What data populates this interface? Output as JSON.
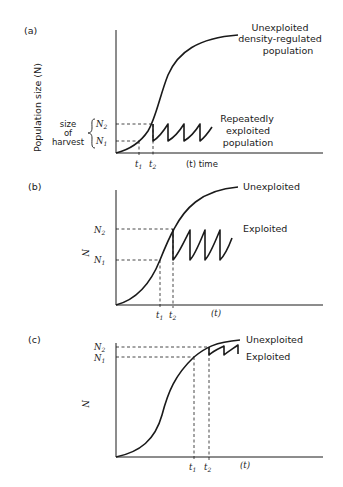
{
  "figure": {
    "panels": [
      {
        "id": "a",
        "label": "(a)",
        "y_axis_label": "Population size (N)",
        "x_axis_label": "(t)  time",
        "ticks": {
          "t1": "t",
          "t1_sub": "1",
          "t2": "t",
          "t2_sub": "2",
          "N1": "N",
          "N1_sub": "1",
          "N2": "N",
          "N2_sub": "2"
        },
        "brace_label": [
          "size",
          "of",
          "harvest"
        ],
        "curve_labels": {
          "unexploited": [
            "Unexploited",
            "density-regulated",
            "population"
          ],
          "exploited": [
            "Repeatedly",
            "exploited",
            "population"
          ]
        }
      },
      {
        "id": "b",
        "label": "(b)",
        "y_axis_label": "N",
        "x_axis_label": "(t)",
        "ticks": {
          "t1": "t",
          "t1_sub": "1",
          "t2": "t",
          "t2_sub": "2",
          "N1": "N",
          "N1_sub": "1",
          "N2": "N",
          "N2_sub": "2"
        },
        "curve_labels": {
          "unexploited": "Unexploited",
          "exploited": "Exploited"
        }
      },
      {
        "id": "c",
        "label": "(c)",
        "y_axis_label": "N",
        "x_axis_label": "(t)",
        "ticks": {
          "t1": "t",
          "t1_sub": "1",
          "t2": "t",
          "t2_sub": "2",
          "N1": "N",
          "N1_sub": "1",
          "N2": "N",
          "N2_sub": "2"
        },
        "curve_labels": {
          "unexploited": "Unexploited",
          "exploited": "Exploited"
        }
      }
    ]
  }
}
